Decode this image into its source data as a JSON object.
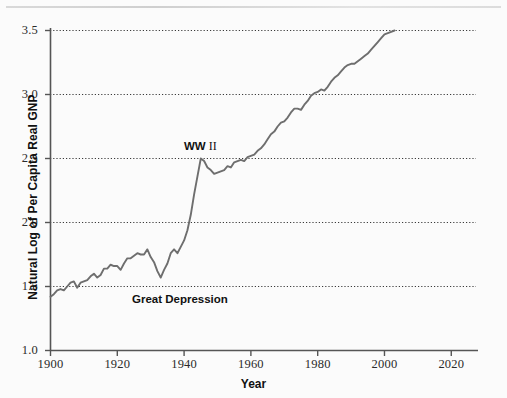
{
  "chart_data": {
    "type": "line",
    "title": "",
    "xlabel": "Year",
    "ylabel": "Natural Log of Per Capita Real GNP",
    "xlim": [
      1900,
      2028
    ],
    "ylim": [
      1.0,
      3.5
    ],
    "xticks": [
      1900,
      1920,
      1940,
      1960,
      1980,
      2000,
      2020
    ],
    "yticks": [
      1.0,
      1.5,
      2.0,
      2.5,
      3.0,
      3.5
    ],
    "xtick_labels": [
      "1900",
      "1920",
      "1940",
      "1960",
      "1980",
      "2000",
      "2020"
    ],
    "ytick_labels": [
      "1.0",
      "1.5",
      "2.0",
      "2.5",
      "3.0",
      "3.5"
    ],
    "grid": "horizontal-dotted",
    "legend": "none",
    "line_color": "#6e6e6e",
    "series": [
      {
        "name": "Natural Log of Per Capita Real GNP",
        "x": [
          1900,
          1901,
          1902,
          1903,
          1904,
          1905,
          1906,
          1907,
          1908,
          1909,
          1910,
          1911,
          1912,
          1913,
          1914,
          1915,
          1916,
          1917,
          1918,
          1919,
          1920,
          1921,
          1922,
          1923,
          1924,
          1925,
          1926,
          1927,
          1928,
          1929,
          1930,
          1931,
          1932,
          1933,
          1934,
          1935,
          1936,
          1937,
          1938,
          1939,
          1940,
          1941,
          1942,
          1943,
          1944,
          1945,
          1946,
          1947,
          1948,
          1949,
          1950,
          1951,
          1952,
          1953,
          1954,
          1955,
          1956,
          1957,
          1958,
          1959,
          1960,
          1961,
          1962,
          1963,
          1964,
          1965,
          1966,
          1967,
          1968,
          1969,
          1970,
          1971,
          1972,
          1973,
          1974,
          1975,
          1976,
          1977,
          1978,
          1979,
          1980,
          1981,
          1982,
          1983,
          1984,
          1985,
          1986,
          1987,
          1988,
          1989,
          1990,
          1991,
          1992,
          1993,
          1994,
          1995,
          1996,
          1997,
          1998,
          1999,
          2000,
          2001,
          2002,
          2003
        ],
        "y": [
          1.42,
          1.44,
          1.47,
          1.48,
          1.47,
          1.5,
          1.53,
          1.54,
          1.49,
          1.53,
          1.54,
          1.55,
          1.58,
          1.6,
          1.57,
          1.59,
          1.64,
          1.64,
          1.67,
          1.66,
          1.66,
          1.63,
          1.68,
          1.72,
          1.72,
          1.74,
          1.76,
          1.75,
          1.75,
          1.79,
          1.73,
          1.69,
          1.62,
          1.57,
          1.63,
          1.68,
          1.76,
          1.79,
          1.76,
          1.81,
          1.86,
          1.94,
          2.06,
          2.22,
          2.36,
          2.5,
          2.48,
          2.43,
          2.41,
          2.38,
          2.39,
          2.4,
          2.41,
          2.44,
          2.43,
          2.47,
          2.48,
          2.49,
          2.48,
          2.51,
          2.52,
          2.53,
          2.56,
          2.58,
          2.61,
          2.65,
          2.69,
          2.71,
          2.75,
          2.78,
          2.79,
          2.82,
          2.86,
          2.89,
          2.89,
          2.88,
          2.92,
          2.95,
          2.99,
          3.01,
          3.02,
          3.04,
          3.03,
          3.06,
          3.1,
          3.13,
          3.15,
          3.18,
          3.21,
          3.23,
          3.24,
          3.24,
          3.26,
          3.28,
          3.3,
          3.32,
          3.35,
          3.38,
          3.41,
          3.44,
          3.47,
          3.48,
          3.49,
          3.5
        ]
      }
    ],
    "annotations": [
      {
        "label_bold": "WW",
        "label_roman": "II",
        "x": 1944,
        "y": 2.52,
        "full_text": "WW II"
      },
      {
        "label": "Great Depression",
        "x": 1933,
        "y": 1.45
      }
    ]
  },
  "axis": {
    "y_title": "Natural Log of Per Capita Real GNP",
    "x_title": "Year"
  },
  "annotations": {
    "wwii_bold": "WW",
    "wwii_numeral": " II",
    "great_depression": "Great Depression"
  }
}
